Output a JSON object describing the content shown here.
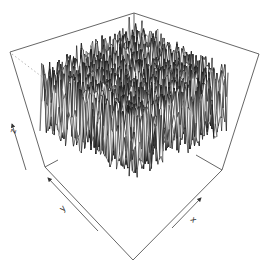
{
  "chart_data": {
    "type": "surface3d",
    "title": "",
    "xlabel": "x",
    "ylabel": "y",
    "zlabel": "z",
    "grid_size": [
      60,
      60
    ],
    "z_distribution": "random uniform noise",
    "z_range": [
      0,
      1
    ],
    "ticks": "none",
    "box": true,
    "colors": {
      "surface_fill": "#ffffff",
      "mesh_line": "#1a1a1a",
      "box_line": "#555555",
      "hidden_line": "#aaaaaa",
      "background": "#ffffff"
    }
  }
}
